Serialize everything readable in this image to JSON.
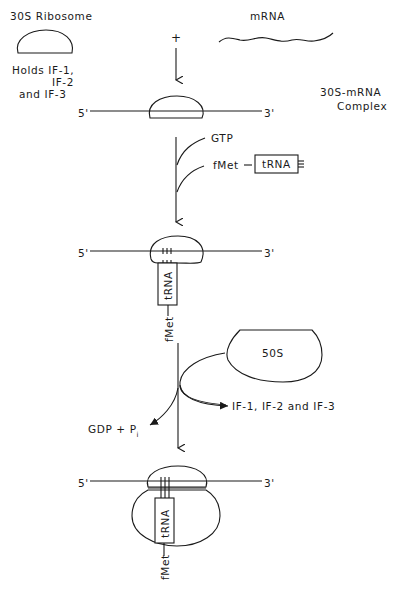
{
  "diagram": {
    "colors": {
      "ink": "#1a1a1a",
      "background": "#ffffff"
    },
    "top": {
      "ribosome_label": "30S Ribosome",
      "holds_line1": "Holds IF-1,",
      "holds_line2": "IF-2",
      "holds_line3": "and IF-3",
      "mrna_label": "mRNA",
      "plus": "+"
    },
    "step1": {
      "five_prime": "5'",
      "three_prime": "3'",
      "complex_line1": "30S-mRNA",
      "complex_line2": "Complex"
    },
    "step2_inputs": {
      "gtp": "GTP",
      "fmet": "fMet",
      "trna": "tRNA"
    },
    "step2": {
      "five_prime": "5'",
      "three_prime": "3'",
      "trna": "tRNA",
      "fmet": "fMet"
    },
    "step3_inputs": {
      "large_subunit": "50S",
      "released_factors": "IF-1, IF-2 and IF-3",
      "gdp": "GDP + P",
      "gdp_sub": "i"
    },
    "step3": {
      "five_prime": "5'",
      "three_prime": "3'",
      "trna": "tRNA",
      "fmet": "fMet"
    }
  }
}
